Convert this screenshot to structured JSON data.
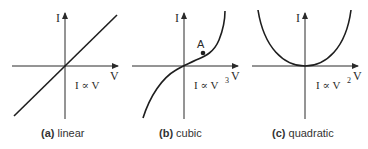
{
  "figure": {
    "panels": [
      {
        "id": "a",
        "tag": "(a)",
        "caption": "linear",
        "y_axis_label": "I",
        "x_axis_label": "V",
        "relation": "I ∝ V",
        "relation_exponent": ""
      },
      {
        "id": "b",
        "tag": "(b)",
        "caption": "cubic",
        "y_axis_label": "I",
        "x_axis_label": "V",
        "relation": "I ∝ V",
        "relation_exponent": "3",
        "point_label": "A"
      },
      {
        "id": "c",
        "tag": "(c)",
        "caption": "quadratic",
        "y_axis_label": "I",
        "x_axis_label": "V",
        "relation": "I ∝ V",
        "relation_exponent": "2"
      }
    ],
    "colors": {
      "line": "#1e1e1e",
      "text": "#333333",
      "background": "#ffffff"
    }
  }
}
